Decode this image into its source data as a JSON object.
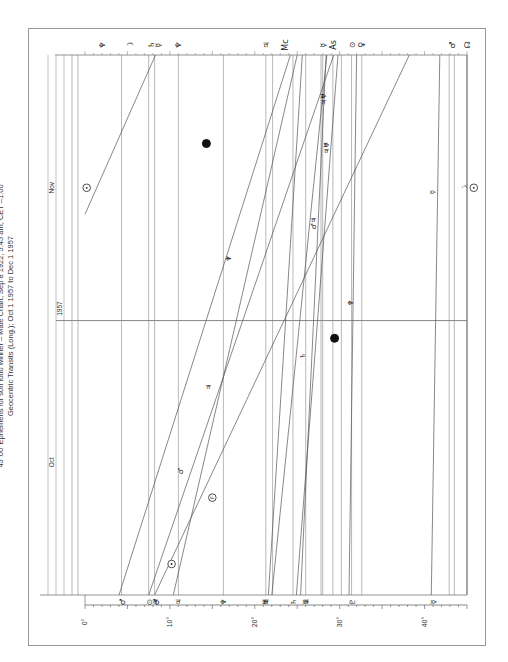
{
  "chart_data": {
    "type": "line",
    "orientation": "rotated-90-ccw",
    "title": "45°00' Ephemeris for son lotto winner – Male Chart, Sep 8 1922, 5:45 am, CET –1:00",
    "subtitle": "Geocentric Transits (Long.); Oct 1 1957 to Dec 1 1957",
    "x_axis": {
      "label": "Longitude (45° harmonic dial)",
      "range": [
        0,
        45
      ],
      "tick_labels": [
        "0°",
        "10°",
        "20°",
        "30°",
        "40°"
      ],
      "tick_values": [
        0,
        10,
        20,
        30,
        40
      ]
    },
    "time_axis": {
      "range": [
        "Oct 1 1957",
        "Dec 1 1957"
      ],
      "month_labels": [
        {
          "label": "Oct",
          "day": 15
        },
        {
          "label": "Nov",
          "day": 46
        }
      ],
      "year_label": {
        "label": "1957",
        "day": 31
      },
      "total_days": 61
    },
    "natal_points": [
      {
        "glyph": "♂",
        "name": "Mars",
        "deg": 4.3
      },
      {
        "glyph": "⊙",
        "name": "Sun",
        "deg": 7.5
      },
      {
        "glyph": "♃",
        "name": "Jupiter",
        "deg": 8.2
      },
      {
        "glyph": "♂",
        "name": "Mars (midpoint)",
        "deg": 8.4
      },
      {
        "glyph": "♃",
        "name": "Jupiter",
        "deg": 11.0
      },
      {
        "glyph": "♆",
        "name": "Neptune",
        "deg": 16.3
      },
      {
        "glyph": "♅",
        "name": "Uranus",
        "deg": 21.2
      },
      {
        "glyph": "♃",
        "name": "Jupiter",
        "deg": 21.3
      },
      {
        "glyph": "♄",
        "name": "Saturn",
        "deg": 24.5
      },
      {
        "glyph": "☿",
        "name": "Mercury",
        "deg": 25.9
      },
      {
        "glyph": "♃",
        "name": "Jupiter",
        "deg": 26.0
      },
      {
        "glyph": "♇",
        "name": "Pluto",
        "deg": 31.4
      },
      {
        "glyph": "☿",
        "name": "Mercury",
        "deg": 41.0
      }
    ],
    "transit_labels_top": [
      {
        "glyph": "♆",
        "deg": 2.0
      },
      {
        "glyph": "☽",
        "deg": 5.3
      },
      {
        "glyph": "♄",
        "deg": 7.8
      },
      {
        "glyph": "☿",
        "deg": 8.6
      },
      {
        "glyph": "♆",
        "deg": 11.0
      },
      {
        "glyph": "♃",
        "deg": 21.3
      },
      {
        "glyph": "Mc",
        "deg": 23.6
      },
      {
        "glyph": "☿",
        "deg": 28.0
      },
      {
        "glyph": "As",
        "deg": 29.2
      },
      {
        "glyph": "⊙",
        "deg": 31.4
      },
      {
        "glyph": "♀",
        "deg": 32.5
      },
      {
        "glyph": "♂",
        "deg": 43.2
      },
      {
        "glyph": "☊",
        "deg": 45.0
      }
    ],
    "vertical_lines_deg": [
      -1.0,
      -0.5,
      4.3,
      7.5,
      8.2,
      11.0,
      16.3,
      21.3,
      22.1,
      24.5,
      26.0,
      27.8,
      28.0,
      29.2,
      30.2,
      31.4,
      32.6,
      42.9,
      43.5
    ],
    "transit_series": [
      {
        "name": "Sun",
        "glyph": "⊙",
        "points": [
          [
            0,
            8.2
          ],
          [
            61,
            38.2
          ]
        ]
      },
      {
        "name": "Sun-late",
        "glyph": "⊙",
        "points": [
          [
            43,
            0.0
          ],
          [
            61,
            8.3
          ]
        ]
      },
      {
        "name": "Mars",
        "glyph": "♂",
        "points": [
          [
            0,
            4.0
          ],
          [
            61,
            24.2
          ]
        ]
      },
      {
        "name": "Jupiter",
        "glyph": "♃",
        "points": [
          [
            0,
            7.5
          ],
          [
            61,
            29.3
          ]
        ]
      },
      {
        "name": "Jupiter-fast",
        "glyph": "♃",
        "points": [
          [
            0,
            10.4
          ],
          [
            61,
            25.0
          ]
        ]
      },
      {
        "name": "Saturn",
        "glyph": "♄",
        "points": [
          [
            0,
            21.6
          ],
          [
            61,
            25.6
          ]
        ]
      },
      {
        "name": "Uranus",
        "glyph": "♅",
        "points": [
          [
            0,
            25.4
          ],
          [
            61,
            28.4
          ]
        ]
      },
      {
        "name": "Neptune",
        "glyph": "♆",
        "points": [
          [
            0,
            24.9
          ],
          [
            61,
            29.8
          ]
        ]
      },
      {
        "name": "Pluto",
        "glyph": "♇",
        "points": [
          [
            0,
            31.1
          ],
          [
            61,
            32.0
          ]
        ]
      },
      {
        "name": "Mercury",
        "glyph": "☿",
        "points": [
          [
            0,
            40.8
          ],
          [
            61,
            41.8
          ]
        ]
      },
      {
        "name": "Mercury-retro",
        "glyph": "☿",
        "points": [
          [
            0,
            22.0
          ],
          [
            61,
            28.5
          ]
        ]
      },
      {
        "name": "Moon-node",
        "glyph": "☊",
        "points": [
          [
            0,
            45.0
          ],
          [
            61,
            45.0
          ]
        ]
      }
    ],
    "event_markers": [
      {
        "glyph": "⊙",
        "label": "Sun station",
        "day": 3.5,
        "deg": 10.2
      },
      {
        "glyph": "F",
        "label": "Fortune",
        "day": 11.0,
        "deg": 15.0
      },
      {
        "glyph": "♂",
        "label": "Mars",
        "day": 14.0,
        "deg": 11.2
      },
      {
        "glyph": "♃",
        "label": "Jupiter",
        "day": 23.5,
        "deg": 14.5
      },
      {
        "glyph": "♄",
        "label": "Saturn",
        "day": 27.0,
        "deg": 25.6
      },
      {
        "glyph": "●",
        "label": "New Moon",
        "day": 29.0,
        "deg": 29.4
      },
      {
        "glyph": "☿",
        "label": "Mercury",
        "day": 45.5,
        "deg": 40.9
      },
      {
        "glyph": "♆",
        "label": "Neptune",
        "day": 38.0,
        "deg": 16.8
      },
      {
        "glyph": "♆",
        "label": "Neptune",
        "day": 33.0,
        "deg": 31.2
      },
      {
        "glyph": "♂♃",
        "label": "Mars/Jupiter",
        "day": 42.0,
        "deg": 26.8
      },
      {
        "glyph": "♃♅",
        "label": "Jupiter/Uranus",
        "day": 50.5,
        "deg": 28.4
      },
      {
        "glyph": "♃♅",
        "label": "Jupiter/Uranus",
        "day": 56.0,
        "deg": 28.0
      },
      {
        "glyph": "●",
        "label": "Full Moon",
        "day": 51.0,
        "deg": 14.3
      },
      {
        "glyph": "⊙",
        "label": "Sun",
        "day": 46.0,
        "deg": 0.2
      },
      {
        "glyph": "☽",
        "label": "Moon",
        "day": 46.0,
        "deg": 44.6
      },
      {
        "glyph": "⊙",
        "label": "Sun",
        "day": 46.0,
        "deg": 45.8
      }
    ]
  },
  "page": {
    "caption_top": "Ephemeris with title"
  }
}
